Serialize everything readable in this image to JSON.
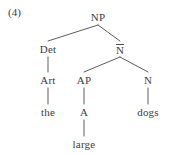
{
  "figure": {
    "number": "(4)",
    "type": "syntax-tree",
    "background_color": "#ffffff",
    "text_color": "#3d3d3d",
    "line_color": "#4a4a4a"
  },
  "tree": {
    "nodes": [
      {
        "id": "np",
        "label": "NP",
        "bar": false,
        "x": 98,
        "y": 12,
        "level": 0
      },
      {
        "id": "det",
        "label": "Det",
        "bar": false,
        "x": 48,
        "y": 44,
        "level": 1
      },
      {
        "id": "nbar",
        "label": "N",
        "bar": true,
        "x": 120,
        "y": 44,
        "level": 1
      },
      {
        "id": "art",
        "label": "Art",
        "bar": false,
        "x": 48,
        "y": 75,
        "level": 2
      },
      {
        "id": "ap",
        "label": "AP",
        "bar": false,
        "x": 84,
        "y": 75,
        "level": 2
      },
      {
        "id": "n",
        "label": "N",
        "bar": false,
        "x": 148,
        "y": 75,
        "level": 2
      },
      {
        "id": "the",
        "label": "the",
        "bar": false,
        "x": 48,
        "y": 107,
        "level": 3
      },
      {
        "id": "a",
        "label": "A",
        "bar": false,
        "x": 84,
        "y": 107,
        "level": 3
      },
      {
        "id": "dogs",
        "label": "dogs",
        "bar": false,
        "x": 148,
        "y": 107,
        "level": 3
      },
      {
        "id": "large",
        "label": "large",
        "bar": false,
        "x": 84,
        "y": 139,
        "level": 4
      }
    ],
    "edges": [
      {
        "from": "np",
        "to": "det",
        "kind": "diagonal"
      },
      {
        "from": "np",
        "to": "nbar",
        "kind": "diagonal"
      },
      {
        "from": "det",
        "to": "art",
        "kind": "vertical"
      },
      {
        "from": "nbar",
        "to": "ap",
        "kind": "diagonal"
      },
      {
        "from": "nbar",
        "to": "n",
        "kind": "diagonal"
      },
      {
        "from": "art",
        "to": "the",
        "kind": "vertical"
      },
      {
        "from": "ap",
        "to": "a",
        "kind": "vertical"
      },
      {
        "from": "n",
        "to": "dogs",
        "kind": "vertical"
      },
      {
        "from": "a",
        "to": "large",
        "kind": "vertical"
      }
    ]
  }
}
